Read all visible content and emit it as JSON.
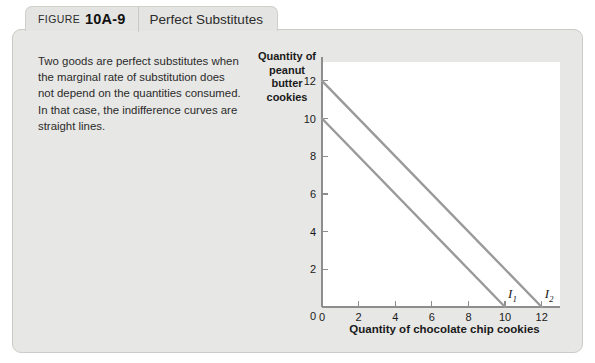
{
  "tab": {
    "word": "FIGURE",
    "number": "10A-9",
    "title": "Perfect Substitutes"
  },
  "caption": "Two goods are perfect substitutes when the marginal rate of substitution does not depend on the quantities consumed. In that case, the indifference curves are straight lines.",
  "colors": {
    "panel_background": "#e7e7e5",
    "tab_background": "#e4e4e2",
    "plot_background": "#ffffff",
    "curve": "#9a9a9a",
    "axis": "#8d8d8d",
    "text": "#1a1a1a"
  },
  "chart_data": {
    "type": "line",
    "title": "",
    "xlabel": "Quantity of chocolate chip cookies",
    "ylabel": "Quantity of peanut butter cookies",
    "xlim": [
      0,
      13
    ],
    "ylim": [
      0,
      13
    ],
    "xticks": [
      0,
      2,
      4,
      6,
      8,
      10,
      12
    ],
    "xtick_labels": [
      "0",
      "2",
      "4",
      "6",
      "8",
      "10",
      "12"
    ],
    "yticks": [
      0,
      2,
      4,
      6,
      8,
      10,
      12
    ],
    "ytick_labels": [
      "0",
      "2",
      "4",
      "6",
      "8",
      "10",
      "12"
    ],
    "grid": false,
    "legend_position": "inline-end-of-line",
    "series": [
      {
        "name": "I1",
        "label": "I",
        "subscript": "1",
        "color": "#9a9a9a",
        "x": [
          0,
          10
        ],
        "y": [
          10,
          0
        ],
        "slope": -1,
        "y_intercept": 10,
        "x_intercept": 10
      },
      {
        "name": "I2",
        "label": "I",
        "subscript": "2",
        "color": "#9a9a9a",
        "x": [
          0,
          12
        ],
        "y": [
          12,
          0
        ],
        "slope": -1,
        "y_intercept": 12,
        "x_intercept": 12
      }
    ]
  }
}
